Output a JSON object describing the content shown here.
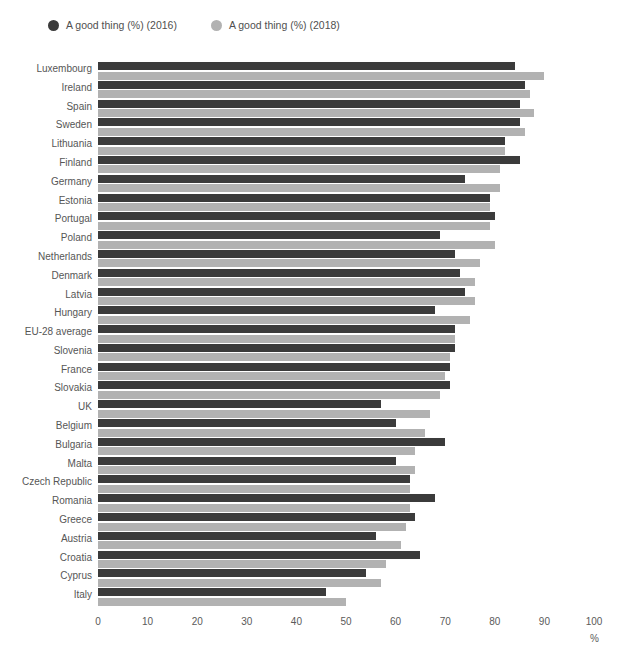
{
  "legend": {
    "position": "top-left",
    "entries": [
      {
        "label": "A good thing (%) (2016)",
        "color": "#3b3b3b",
        "icon": "circle-marker"
      },
      {
        "label": "A good thing (%) (2018)",
        "color": "#b2b2b2",
        "icon": "circle-marker"
      }
    ]
  },
  "axis": {
    "unit_label": "%",
    "ticks": [
      "0",
      "10",
      "20",
      "30",
      "40",
      "50",
      "60",
      "70",
      "80",
      "90",
      "100"
    ]
  },
  "chart_data": {
    "type": "bar",
    "orientation": "horizontal",
    "title": "",
    "subtitle": "",
    "xlabel": "%",
    "ylabel": "",
    "xlim": [
      0,
      100
    ],
    "xticks": [
      0,
      10,
      20,
      30,
      40,
      50,
      60,
      70,
      80,
      90,
      100
    ],
    "grid": false,
    "legend_position": "top-left",
    "categories": [
      "Luxembourg",
      "Ireland",
      "Spain",
      "Sweden",
      "Lithuania",
      "Finland",
      "Germany",
      "Estonia",
      "Portugal",
      "Poland",
      "Netherlands",
      "Denmark",
      "Latvia",
      "Hungary",
      "EU-28 average",
      "Slovenia",
      "France",
      "Slovakia",
      "UK",
      "Belgium",
      "Bulgaria",
      "Malta",
      "Czech Republic",
      "Romania",
      "Greece",
      "Austria",
      "Croatia",
      "Cyprus",
      "Italy"
    ],
    "series": [
      {
        "name": "A good thing (%) (2016)",
        "color": "#3b3b3b",
        "values": [
          84,
          86,
          85,
          85,
          82,
          85,
          74,
          79,
          80,
          69,
          72,
          73,
          74,
          68,
          72,
          72,
          71,
          71,
          57,
          60,
          70,
          60,
          63,
          68,
          64,
          56,
          65,
          54,
          46
        ]
      },
      {
        "name": "A good thing (%) (2018)",
        "color": "#b2b2b2",
        "values": [
          90,
          87,
          88,
          86,
          82,
          81,
          81,
          79,
          79,
          80,
          77,
          76,
          76,
          75,
          72,
          71,
          70,
          69,
          67,
          66,
          64,
          64,
          63,
          63,
          62,
          61,
          58,
          57,
          50
        ]
      }
    ]
  }
}
